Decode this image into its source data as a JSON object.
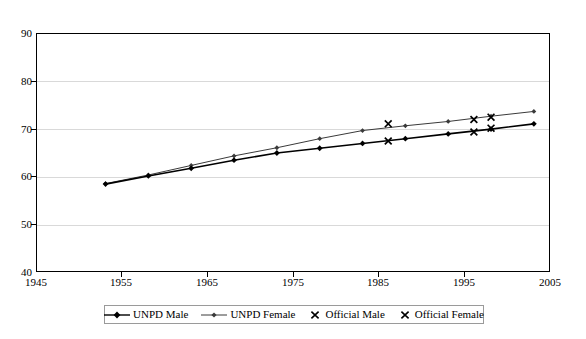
{
  "chart_data": {
    "type": "line",
    "title": "Life expectancy at birth",
    "xlabel": "",
    "ylabel": "",
    "xlim": [
      1945,
      2005
    ],
    "ylim": [
      40,
      90
    ],
    "xticks": [
      1945,
      1955,
      1965,
      1975,
      1985,
      1995,
      2005
    ],
    "yticks": [
      40,
      50,
      60,
      70,
      80,
      90
    ],
    "grid": "horizontal",
    "legend_position": "bottom",
    "series": [
      {
        "name": "UNPD Male",
        "marker": "diamond",
        "style": "line",
        "color": "#000000",
        "x": [
          1953,
          1958,
          1963,
          1968,
          1973,
          1978,
          1983,
          1988,
          1993,
          1998,
          2003
        ],
        "values": [
          58.6,
          60.3,
          61.9,
          63.6,
          65.1,
          66.1,
          67.1,
          68.1,
          69.1,
          70.1,
          71.2
        ]
      },
      {
        "name": "UNPD Female",
        "marker": "diamond",
        "style": "line",
        "color": "#3a3a3a",
        "x": [
          1953,
          1958,
          1963,
          1968,
          1973,
          1978,
          1983,
          1988,
          1993,
          1998,
          2003
        ],
        "values": [
          58.7,
          60.5,
          62.5,
          64.5,
          66.2,
          68.1,
          69.8,
          70.8,
          71.7,
          72.8,
          73.8
        ]
      },
      {
        "name": "Official Male",
        "marker": "x",
        "style": "scatter",
        "color": "#000000",
        "x": [
          1986,
          1996,
          1998
        ],
        "values": [
          67.6,
          69.5,
          70.3
        ]
      },
      {
        "name": "Official Female",
        "marker": "x",
        "style": "scatter",
        "color": "#000000",
        "x": [
          1986,
          1996,
          1998
        ],
        "values": [
          71.2,
          72.1,
          72.6
        ]
      }
    ],
    "annotations": []
  },
  "legend": {
    "items": [
      {
        "label": "UNPD Male"
      },
      {
        "label": "UNPD Female"
      },
      {
        "label": "Official Male"
      },
      {
        "label": "Official Female"
      }
    ]
  },
  "axes": {
    "y_labels": [
      "90",
      "80",
      "70",
      "60",
      "50",
      "40"
    ],
    "x_labels": [
      "1945",
      "1955",
      "1965",
      "1975",
      "1985",
      "1995",
      "2005"
    ]
  }
}
